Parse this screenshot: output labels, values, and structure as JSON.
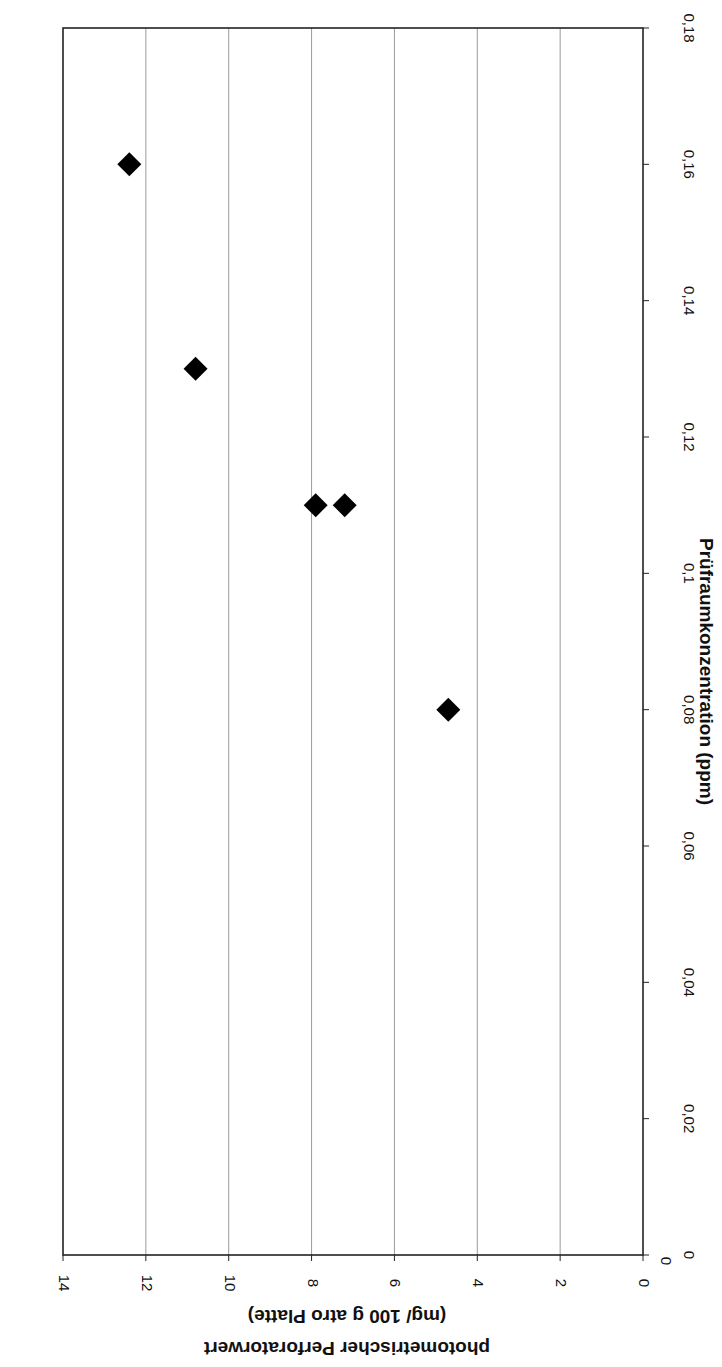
{
  "chart_data": {
    "type": "scatter",
    "orientation_note": "figure rotated 90° clockwise on page",
    "title": "",
    "xlabel": "Prüfraumkonzentration (ppm)",
    "ylabel_line1": "photometrischer Perforatorwert",
    "ylabel_line2": "(mg/ 100 g atro Platte)",
    "xlim": [
      0,
      0.18
    ],
    "ylim": [
      0,
      14
    ],
    "x_ticks": [
      "0",
      "0,02",
      "0,04",
      "0,06",
      "0,08",
      "0,1",
      "0,12",
      "0,14",
      "0,16",
      "0,18"
    ],
    "x_tick_values": [
      0,
      0.02,
      0.04,
      0.06,
      0.08,
      0.1,
      0.12,
      0.14,
      0.16,
      0.18
    ],
    "y_ticks": [
      "0",
      "2",
      "4",
      "6",
      "8",
      "10",
      "12",
      "14"
    ],
    "y_tick_values": [
      0,
      2,
      4,
      6,
      8,
      10,
      12,
      14
    ],
    "grid": "horizontal major gridlines on y",
    "legend": null,
    "marker": "diamond",
    "marker_color": "#000000",
    "series": [
      {
        "name": "Messwerte",
        "points": [
          {
            "x": 0.08,
            "y": 4.7
          },
          {
            "x": 0.11,
            "y": 7.2
          },
          {
            "x": 0.11,
            "y": 7.9
          },
          {
            "x": 0.13,
            "y": 10.8
          },
          {
            "x": 0.16,
            "y": 12.4
          }
        ]
      }
    ]
  }
}
